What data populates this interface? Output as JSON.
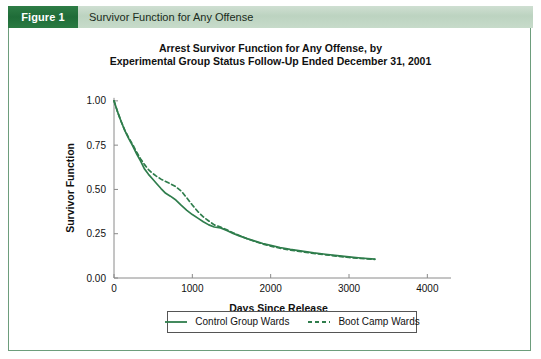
{
  "figure": {
    "number_label": "Figure 1",
    "caption": "Survivor Function for Any Offense"
  },
  "chart_data": {
    "type": "line",
    "title": "Arrest Survivor Function for Any Offense, by Experimental Group Status Follow-Up Ended December 31, 2001",
    "title_line1": "Arrest Survivor Function for Any Offense, by",
    "title_line2": "Experimental Group Status Follow-Up Ended December 31, 2001",
    "xlabel": "Days Since Release",
    "ylabel": "Survivor Function",
    "xlim": [
      0,
      4200
    ],
    "ylim": [
      0.0,
      1.05
    ],
    "xticks": [
      0,
      1000,
      2000,
      3000,
      4000
    ],
    "xtick_labels": [
      "0",
      "1000",
      "2000",
      "3000",
      "4000"
    ],
    "yticks": [
      0.0,
      0.25,
      0.5,
      0.75,
      1.0
    ],
    "ytick_labels": [
      "0.00",
      "0.25",
      "0.50",
      "0.75",
      "1.00"
    ],
    "grid": false,
    "legend_position": "below-axes",
    "accent_color": "#2e7d46",
    "line_color": "#2f7d4c",
    "series": [
      {
        "name": "Control Group Wards",
        "style": "solid",
        "color": "#2f7d4c",
        "x": [
          0,
          40,
          90,
          140,
          190,
          240,
          290,
          340,
          390,
          440,
          490,
          540,
          600,
          660,
          720,
          790,
          860,
          930,
          1000,
          1070,
          1140,
          1210,
          1280,
          1360,
          1440,
          1520,
          1600,
          1700,
          1800,
          1900,
          2000,
          2120,
          2250,
          2400,
          2550,
          2700,
          2850,
          3000,
          3150,
          3330
        ],
        "y": [
          1.0,
          0.945,
          0.885,
          0.83,
          0.785,
          0.745,
          0.7,
          0.66,
          0.615,
          0.585,
          0.56,
          0.535,
          0.505,
          0.478,
          0.462,
          0.44,
          0.41,
          0.382,
          0.358,
          0.338,
          0.318,
          0.3,
          0.288,
          0.283,
          0.268,
          0.252,
          0.238,
          0.222,
          0.208,
          0.195,
          0.184,
          0.172,
          0.162,
          0.152,
          0.142,
          0.134,
          0.126,
          0.119,
          0.113,
          0.107
        ]
      },
      {
        "name": "Boot Camp Wards",
        "style": "dashed",
        "color": "#2f7d4c",
        "x": [
          0,
          40,
          90,
          140,
          190,
          240,
          290,
          340,
          390,
          440,
          490,
          540,
          600,
          660,
          720,
          790,
          860,
          930,
          1000,
          1070,
          1140,
          1210,
          1280,
          1360,
          1440,
          1520,
          1600,
          1700,
          1800,
          1900,
          2000,
          2120,
          2250,
          2400,
          2550,
          2700,
          2850,
          3000,
          3150,
          3330
        ],
        "y": [
          1.0,
          0.945,
          0.885,
          0.832,
          0.79,
          0.752,
          0.71,
          0.672,
          0.64,
          0.612,
          0.592,
          0.575,
          0.558,
          0.545,
          0.532,
          0.515,
          0.49,
          0.452,
          0.412,
          0.375,
          0.345,
          0.322,
          0.3,
          0.288,
          0.272,
          0.255,
          0.24,
          0.222,
          0.206,
          0.192,
          0.18,
          0.168,
          0.158,
          0.148,
          0.139,
          0.131,
          0.123,
          0.116,
          0.11,
          0.105
        ]
      }
    ],
    "legend": [
      {
        "label": "Control Group Wards",
        "style": "solid"
      },
      {
        "label": "Boot Camp Wards",
        "style": "dashed"
      }
    ]
  }
}
